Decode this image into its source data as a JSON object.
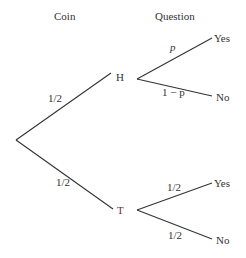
{
  "headers": {
    "coin": "Coin",
    "question": "Question"
  },
  "nodes": {
    "heads": "H",
    "tails": "T"
  },
  "coin_branches": {
    "heads_prob": "1/2",
    "tails_prob": "1/2"
  },
  "heads_branches": {
    "yes_prob": "p",
    "no_prob": "1 − p",
    "yes": "Yes",
    "no": "No"
  },
  "tails_branches": {
    "yes_prob": "1/2",
    "no_prob": "1/2",
    "yes": "Yes",
    "no": "No"
  },
  "colors": {
    "line": "#333333",
    "tails_node": "#7a2a2a"
  }
}
